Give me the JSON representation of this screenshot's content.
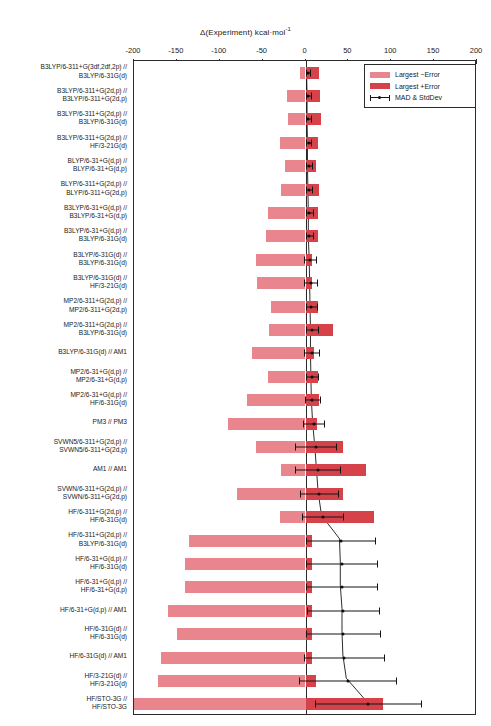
{
  "chart_data": {
    "type": "bar",
    "title": "Δ(Experiment) kcal·mol",
    "title_superscript": "-1",
    "xlabel": "Δ(Experiment) kcal·mol⁻¹",
    "ylabel": "",
    "orientation": "horizontal",
    "xlim": [
      -200,
      200
    ],
    "xticks": [
      -200,
      -150,
      -100,
      -50,
      0,
      50,
      100,
      150,
      200
    ],
    "xticklabels": [
      "-200",
      "-150",
      "-100",
      "-50",
      "0",
      "50",
      "100",
      "150",
      "200"
    ],
    "grid": false,
    "legend_position": "top-right",
    "colors": {
      "negative_error": "#e9868d",
      "positive_error": "#d6424a",
      "mad_line": "#141414",
      "axis": "#2b2b2b"
    },
    "legend": [
      {
        "label": "Largest −Error",
        "key": "negative_error",
        "style": "bar-light"
      },
      {
        "label": "Largest +Error",
        "key": "positive_error",
        "style": "bar-dark"
      },
      {
        "label": "MAD & StdDev",
        "key": "mad_stddev",
        "style": "errorbar-marker"
      }
    ],
    "series": [
      {
        "name": "Largest −Error",
        "key": "neg_error"
      },
      {
        "name": "Largest +Error",
        "key": "pos_error"
      },
      {
        "name": "MAD & StdDev",
        "key": "mad"
      }
    ],
    "categories": [
      "B3LYP/6-311+G(3df,2df,2p) //\nB3LYP/6-31G(d)",
      "B3LYP/6-311+G(2d,p) //\nB3LYP/6-311+G(2d,p)",
      "B3LYP/6-311+G(2d,p) //\nB3LYP/6-31G(d)",
      "B3LYP/6-311+G(2d,p) //\nHF/3-21G(d)",
      "BLYP/6-31+G(d,p) //\nBLYP/6-31+G(d,p)",
      "BLYP/6-311+G(2d,p) //\nBLYP/6-311+G(2d,p)",
      "B3LYP/6-31+G(d,p) //\nB3LYP/6-31+G(d,p)",
      "B3LYP/6-31+G(d,p) //\nB3LYP/6-31G(d)",
      "B3LYP/6-31G(d) //\nB3LYP/6-31G(d)",
      "B3LYP/6-31G(d) //\nHF/3-21G(d)",
      "MP2/6-311+G(2d,p) //\nMP2/6-311+G(2d,p)",
      "MP2/6-311+G(2d,p) //\nB3LYP/6-31G(d)",
      "B3LYP/6-31G(d) // AM1",
      "MP2/6-31+G(d,p) //\nMP2/6-31+G(d,p)",
      "MP2/6-31+G(d,p) //\nHF/6-31G(d)",
      "PM3 // PM3",
      "SVWN5/6-311+G(2d,p) //\nSVWN5/6-311+G(2d,p)",
      "AM1 // AM1",
      "SVWN/6-311+G(2d,p) //\nSVWN/6-311+G(2d,p)",
      "HF/6-311+G(2d,p) //\nHF/6-31G(d)",
      "HF/6-311+G(2d,p) //\nB3LYP/6-31G(d)",
      "HF/6-31+G(d,p) //\nHF/6-31G(d)",
      "HF/6-31+G(d,p) //\nHF/6-31+G(d,p)",
      "HF/6-31+G(d,p) // AM1",
      "HF/6-31G(d) //\nHF/6-31G(d)",
      "HF/6-31G(d) // AM1",
      "HF/3-21G(d) //\nHF/3-21G(d)",
      "HF/STO-3G //\nHF/STO-3G"
    ],
    "rows": [
      {
        "category": "B3LYP/6-311+G(3df,2df,2p) // B3LYP/6-31G(d)",
        "neg_error": -6,
        "pos_error": 16,
        "mad": 2.5,
        "std": 2.5
      },
      {
        "category": "B3LYP/6-311+G(2d,p) // B3LYP/6-311+G(2d,p)",
        "neg_error": -22,
        "pos_error": 17,
        "mad": 3.0,
        "std": 3.0
      },
      {
        "category": "B3LYP/6-311+G(2d,p) // B3LYP/6-31G(d)",
        "neg_error": -20,
        "pos_error": 18,
        "mad": 3.0,
        "std": 3.0
      },
      {
        "category": "B3LYP/6-311+G(2d,p) // HF/3-21G(d)",
        "neg_error": -30,
        "pos_error": 15,
        "mad": 3.5,
        "std": 3.0
      },
      {
        "category": "BLYP/6-31+G(d,p) // BLYP/6-31+G(d,p)",
        "neg_error": -24,
        "pos_error": 12,
        "mad": 3.5,
        "std": 3.5
      },
      {
        "category": "BLYP/6-311+G(2d,p) // BLYP/6-311+G(2d,p)",
        "neg_error": -28,
        "pos_error": 16,
        "mad": 4.0,
        "std": 3.5
      },
      {
        "category": "B3LYP/6-31+G(d,p) // B3LYP/6-31+G(d,p)",
        "neg_error": -44,
        "pos_error": 14,
        "mad": 4.5,
        "std": 4.5
      },
      {
        "category": "B3LYP/6-31+G(d,p) // B3LYP/6-31G(d)",
        "neg_error": -46,
        "pos_error": 14,
        "mad": 4.5,
        "std": 4.5
      },
      {
        "category": "B3LYP/6-31G(d) // B3LYP/6-31G(d)",
        "neg_error": -58,
        "pos_error": 7,
        "mad": 5.5,
        "std": 7.0
      },
      {
        "category": "B3LYP/6-31G(d) // HF/3-21G(d)",
        "neg_error": -56,
        "pos_error": 7,
        "mad": 6.0,
        "std": 7.5
      },
      {
        "category": "MP2/6-311+G(2d,p) // MP2/6-311+G(2d,p)",
        "neg_error": -40,
        "pos_error": 15,
        "mad": 6.5,
        "std": 6.5
      },
      {
        "category": "MP2/6-311+G(2d,p) // B3LYP/6-31G(d)",
        "neg_error": -42,
        "pos_error": 32,
        "mad": 7.0,
        "std": 7.0
      },
      {
        "category": "B3LYP/6-31G(d) // AM1",
        "neg_error": -62,
        "pos_error": 10,
        "mad": 7.0,
        "std": 9.0
      },
      {
        "category": "MP2/6-31+G(d,p) // MP2/6-31+G(d,p)",
        "neg_error": -44,
        "pos_error": 15,
        "mad": 7.5,
        "std": 7.5
      },
      {
        "category": "MP2/6-31+G(d,p) // HF/6-31G(d)",
        "neg_error": -68,
        "pos_error": 16,
        "mad": 8.0,
        "std": 9.0
      },
      {
        "category": "PM3 // PM3",
        "neg_error": -90,
        "pos_error": 13,
        "mad": 9.5,
        "std": 12.0
      },
      {
        "category": "SVWN5/6-311+G(2d,p) // SVWN5/6-311+G(2d,p)",
        "neg_error": -58,
        "pos_error": 44,
        "mad": 12.0,
        "std": 24.0
      },
      {
        "category": "AM1 // AM1",
        "neg_error": -28,
        "pos_error": 70,
        "mad": 14.0,
        "std": 26.0
      },
      {
        "category": "SVWN/6-311+G(2d,p) // SVWN/6-311+G(2d,p)",
        "neg_error": -80,
        "pos_error": 44,
        "mad": 16.0,
        "std": 22.0
      },
      {
        "category": "HF/6-311+G(2d,p) // HF/6-31G(d)",
        "neg_error": -30,
        "pos_error": 80,
        "mad": 20.0,
        "std": 24.0
      },
      {
        "category": "HF/6-311+G(2d,p) // B3LYP/6-31G(d)",
        "neg_error": -136,
        "pos_error": 7,
        "mad": 41.0,
        "std": 40.0
      },
      {
        "category": "HF/6-31+G(d,p) // HF/6-31G(d)",
        "neg_error": -140,
        "pos_error": 7,
        "mad": 42.0,
        "std": 41.0
      },
      {
        "category": "HF/6-31+G(d,p) // HF/6-31+G(d,p)",
        "neg_error": -140,
        "pos_error": 7,
        "mad": 42.0,
        "std": 41.0
      },
      {
        "category": "HF/6-31+G(d,p) // AM1",
        "neg_error": -160,
        "pos_error": 7,
        "mad": 44.0,
        "std": 42.0
      },
      {
        "category": "HF/6-31G(d) // HF/6-31G(d)",
        "neg_error": -150,
        "pos_error": 7,
        "mad": 44.0,
        "std": 43.0
      },
      {
        "category": "HF/6-31G(d) // AM1",
        "neg_error": -168,
        "pos_error": 7,
        "mad": 45.0,
        "std": 47.0
      },
      {
        "category": "HF/3-21G(d) // HF/3-21G(d)",
        "neg_error": -172,
        "pos_error": 12,
        "mad": 49.0,
        "std": 57.0
      },
      {
        "category": "HF/STO-3G // HF/STO-3G",
        "neg_error": -205,
        "pos_error": 90,
        "mad": 73.0,
        "std": 62.0
      }
    ]
  }
}
